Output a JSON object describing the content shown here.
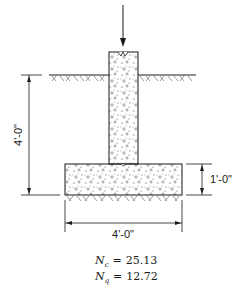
{
  "diagram": {
    "labels": {
      "depth_dimension": "4'-0\"",
      "thickness_dimension": "1'-0\"",
      "width_dimension": "4'-0\""
    },
    "equations": [
      {
        "symbol": "N",
        "subscript": "c",
        "operator": "=",
        "value": "25.13"
      },
      {
        "symbol": "N",
        "subscript": "q",
        "operator": "=",
        "value": "12.72"
      }
    ],
    "elements": {
      "load_arrow": "applied column load",
      "column": "concrete column",
      "footing": "concrete footing",
      "ground_surface": "ground hatch",
      "soil_below_footing": "soil hatch"
    },
    "colors": {
      "line": "#1a1a1a",
      "background": "#ffffff"
    }
  }
}
